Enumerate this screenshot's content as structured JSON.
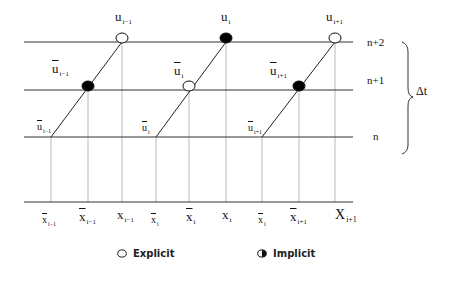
{
  "diagram": {
    "title": "",
    "time_levels": [
      "n+2",
      "n+1",
      "n"
    ],
    "delta_label": "Δt",
    "top_labels": [
      {
        "main": "u",
        "sub": "i−1"
      },
      {
        "main": "u",
        "sub": "i"
      },
      {
        "main": "u",
        "sub": "i+1"
      }
    ],
    "mid_labels": [
      {
        "main": "u",
        "sub": "i−1",
        "bar": true
      },
      {
        "main": "u",
        "sub": "i",
        "bar": true
      },
      {
        "main": "u",
        "sub": "i+1",
        "bar": true
      }
    ],
    "foot_labels": [
      {
        "main": "u",
        "sub": "i−1",
        "bar": true
      },
      {
        "main": "u",
        "sub": "i",
        "bar": true
      },
      {
        "main": "u",
        "sub": "i+1",
        "bar": true
      }
    ],
    "axis_labels": [
      {
        "main": "x",
        "sub": "i−1",
        "bar": true,
        "size": "small"
      },
      {
        "main": "x",
        "sub": "i−1",
        "bar": true,
        "size": "normal"
      },
      {
        "main": "x",
        "sub": "i−1",
        "bar": false,
        "size": "normal"
      },
      {
        "main": "x",
        "sub": "i",
        "bar": true,
        "size": "small"
      },
      {
        "main": "x",
        "sub": "i",
        "bar": true,
        "size": "normal"
      },
      {
        "main": "x",
        "sub": "i",
        "bar": false,
        "size": "normal"
      },
      {
        "main": "x",
        "sub": "i",
        "bar": true,
        "size": "small"
      },
      {
        "main": "x",
        "sub": "i+1",
        "bar": true,
        "size": "normal"
      },
      {
        "main": "X",
        "sub": "i+1",
        "bar": false,
        "size": "big"
      }
    ],
    "points": [
      {
        "label": "u_{i-1} at n+2",
        "type": "explicit"
      },
      {
        "label": "ū_{i-1} at n+1",
        "type": "implicit"
      },
      {
        "label": "u_i at n+2",
        "type": "implicit"
      },
      {
        "label": "ū_i at n+1",
        "type": "explicit"
      },
      {
        "label": "u_{i+1} at n+2",
        "type": "explicit"
      },
      {
        "label": "ū_{i+1} at n+1",
        "type": "implicit"
      }
    ],
    "colors": {
      "line": "#333333",
      "grid": "#888888",
      "fill": "#000000"
    }
  },
  "legend": {
    "explicit_label": "Explicit",
    "implicit_label": "Implicit"
  }
}
